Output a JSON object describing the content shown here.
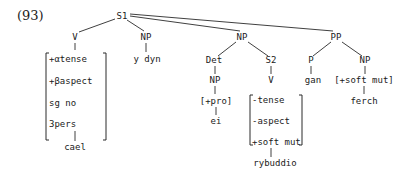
{
  "example_number": "(93)",
  "tree": {
    "root": "S1",
    "children": {
      "v1": {
        "label": "V",
        "features": [
          "+αtense",
          "+βaspect",
          "sg no",
          "3pers"
        ],
        "leaf": "cael"
      },
      "np1": {
        "label": "NP",
        "leaf": "y dyn"
      },
      "np2": {
        "label": "NP",
        "det": {
          "label": "Det",
          "np": "NP",
          "feature": "[+pro]",
          "leaf": "ei"
        },
        "s2": {
          "label": "S2",
          "v": "V",
          "features": [
            "-tense",
            "-aspect",
            "+soft mut"
          ],
          "leaf": "rybuddio"
        }
      },
      "pp": {
        "label": "PP",
        "p": {
          "label": "P",
          "leaf": "gan"
        },
        "np": {
          "label": "NP",
          "feature": "[+soft mut]",
          "leaf": "ferch"
        }
      }
    }
  }
}
